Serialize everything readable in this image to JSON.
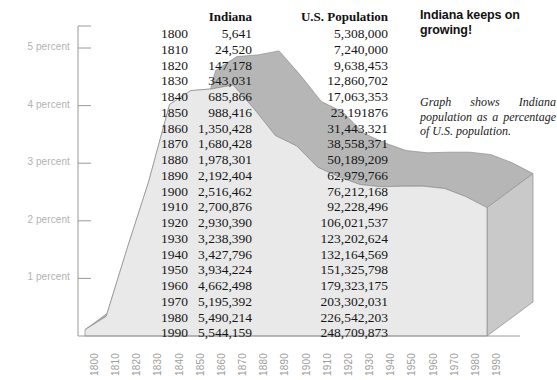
{
  "headline": "Indiana keeps on growing!",
  "caption": "Graph shows Indiana population as a percentage of U.S. population.",
  "table": {
    "headers": {
      "year": "",
      "indiana": "Indiana",
      "us": "U.S. Population"
    },
    "rows": [
      {
        "year": "1800",
        "indiana": "5,641",
        "us": "5,308,000"
      },
      {
        "year": "1810",
        "indiana": "24,520",
        "us": "7,240,000"
      },
      {
        "year": "1820",
        "indiana": "147,178",
        "us": "9,638,453"
      },
      {
        "year": "1830",
        "indiana": "343,031",
        "us": "12,860,702"
      },
      {
        "year": "1840",
        "indiana": "685,866",
        "us": "17,063,353"
      },
      {
        "year": "1850",
        "indiana": "988,416",
        "us": "23,191876"
      },
      {
        "year": "1860",
        "indiana": "1,350,428",
        "us": "31,443,321"
      },
      {
        "year": "1870",
        "indiana": "1,680,428",
        "us": "38,558,371"
      },
      {
        "year": "1880",
        "indiana": "1,978,301",
        "us": "50,189,209"
      },
      {
        "year": "1890",
        "indiana": "2,192,404",
        "us": "62,979,766"
      },
      {
        "year": "1900",
        "indiana": "2,516,462",
        "us": "76,212,168"
      },
      {
        "year": "1910",
        "indiana": "2,700,876",
        "us": "92,228,496"
      },
      {
        "year": "1920",
        "indiana": "2,930,390",
        "us": "106,021,537"
      },
      {
        "year": "1930",
        "indiana": "3,238,390",
        "us": "123,202,624"
      },
      {
        "year": "1940",
        "indiana": "3,427,796",
        "us": "132,164,569"
      },
      {
        "year": "1950",
        "indiana": "3,934,224",
        "us": "151,325,798"
      },
      {
        "year": "1960",
        "indiana": "4,662,498",
        "us": "179,323,175"
      },
      {
        "year": "1970",
        "indiana": "5,195,392",
        "us": "203,302,031"
      },
      {
        "year": "1980",
        "indiana": "5,490,214",
        "us": "226,542,203"
      },
      {
        "year": "1990",
        "indiana": "5,544,159",
        "us": "248,709,873"
      }
    ]
  },
  "colors": {
    "front_face": "#e9e9e9",
    "top_face": "#b6b6b6",
    "side_face": "#c9c9c9",
    "outline": "#8e8e8e",
    "axis": "#9a9a9a",
    "axis_label": "#b2b2b2"
  },
  "chart_data": {
    "type": "area",
    "title": "Indiana keeps on growing!",
    "subtitle": "Graph shows Indiana population as a percentage of U.S. population.",
    "xlabel": "",
    "ylabel": "percent",
    "grid": false,
    "legend": false,
    "xlim": [
      1800,
      1990
    ],
    "ylim": [
      0,
      5.6
    ],
    "x": [
      1800,
      1810,
      1820,
      1830,
      1840,
      1850,
      1860,
      1870,
      1880,
      1890,
      1900,
      1910,
      1920,
      1930,
      1940,
      1950,
      1960,
      1970,
      1980,
      1990
    ],
    "xticklabels": [
      "1800",
      "1810",
      "1820",
      "1830",
      "1840",
      "1850",
      "1860",
      "1870",
      "1880",
      "1890",
      "1900",
      "1910",
      "1920",
      "1930",
      "1940",
      "1950",
      "1960",
      "1970",
      "1980",
      "1990"
    ],
    "yticks": [
      1,
      2,
      3,
      4,
      5
    ],
    "yticklabels": [
      "1 percent",
      "2 percent",
      "3 percent",
      "4 percent",
      "5 percent"
    ],
    "series": [
      {
        "name": "Indiana population as percent of U.S. population",
        "values": [
          0.11,
          0.34,
          1.53,
          2.67,
          4.02,
          4.26,
          4.29,
          4.36,
          3.94,
          3.48,
          3.3,
          2.93,
          2.76,
          2.63,
          2.59,
          2.6,
          2.6,
          2.56,
          2.42,
          2.23
        ]
      }
    ],
    "source_columns": {
      "indiana_population": [
        5641,
        24520,
        147178,
        343031,
        685866,
        988416,
        1350428,
        1680428,
        1978301,
        2192404,
        2516462,
        2700876,
        2930390,
        3238390,
        3427796,
        3934224,
        4662498,
        5195392,
        5490214,
        5544159
      ],
      "us_population": [
        5308000,
        7240000,
        9638453,
        12860702,
        17063353,
        23191876,
        31443321,
        38558371,
        50189209,
        62979766,
        76212168,
        92228496,
        106021537,
        123202624,
        132164569,
        151325798,
        179323175,
        203302031,
        226542203,
        248709873
      ]
    }
  }
}
